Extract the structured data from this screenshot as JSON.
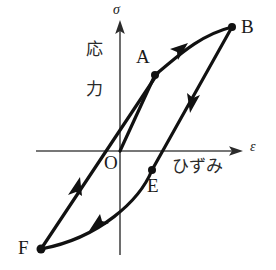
{
  "figure": {
    "kind": "stress-strain-hysteresis-diagram",
    "axes": {
      "vertical": {
        "symbol": "σ",
        "name_jp_char1": "応",
        "name_jp_char2": "力",
        "name_jp": "応力",
        "arrow": "up"
      },
      "horizontal": {
        "symbol": "ε",
        "name_jp": "ひずみ",
        "arrow": "right"
      },
      "origin_label": "O"
    },
    "points": [
      {
        "id": "O",
        "label": "O",
        "x": 120,
        "y": 151,
        "dot": false
      },
      {
        "id": "A",
        "label": "A",
        "x": 155,
        "y": 75,
        "dot": true
      },
      {
        "id": "B",
        "label": "B",
        "x": 232,
        "y": 27,
        "dot": true
      },
      {
        "id": "E",
        "label": "E",
        "x": 152,
        "y": 170,
        "dot": true
      },
      {
        "id": "F",
        "label": "F",
        "x": 41,
        "y": 249,
        "dot": true
      }
    ],
    "path_arrows": [
      {
        "segment": "A-to-B",
        "direction": "up-right"
      },
      {
        "segment": "B-to-E",
        "direction": "down-left"
      },
      {
        "segment": "E-to-F",
        "direction": "left-down"
      },
      {
        "segment": "F-to-A",
        "direction": "up-right"
      }
    ],
    "stroke_color": "#111111",
    "axis_color": "#4a4a4a"
  }
}
